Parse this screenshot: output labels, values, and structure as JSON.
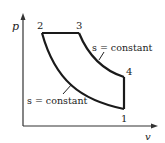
{
  "diagram": {
    "type": "p-v diagram",
    "axes": {
      "y_label": "p",
      "x_label": "v"
    },
    "points": [
      {
        "id": "1",
        "label": "1"
      },
      {
        "id": "2",
        "label": "2"
      },
      {
        "id": "3",
        "label": "3"
      },
      {
        "id": "4",
        "label": "4"
      }
    ],
    "annotations": {
      "upper": "s = constant",
      "lower": "s = constant"
    },
    "colors": {
      "line": "#1a1a1a",
      "axis": "#333333",
      "text": "#222222"
    }
  }
}
